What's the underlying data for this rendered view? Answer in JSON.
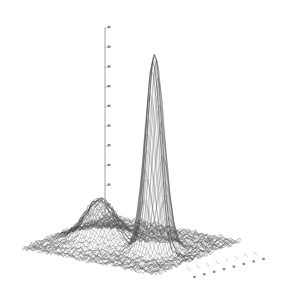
{
  "figure": {
    "kind": "3d-wireframe-surface-plot",
    "background_color": "#ffffff",
    "line_color": "#3a3a3a",
    "mesh_color": "#555555",
    "axis_color": "#8a8a8a",
    "tick_label_color": "#5a5a5a",
    "has_title": false,
    "has_legend": false,
    "has_frame": false,
    "title": "",
    "subtitle": "",
    "note": "Grayscale mesh surface rendered on plain white ground; no visible title, legend, border or colorbar."
  },
  "zaxis": {
    "name": "vertical-axis",
    "label": "",
    "tick_count": 11,
    "tick_labels": [
      "",
      "",
      "",
      "",
      "",
      "",
      "",
      "",
      "",
      "",
      ""
    ],
    "tick_labels_legible": false,
    "tick_label_note": "Z tick annotations are rendered at sub-pixel size in the source image and are not legible; shown as unreadable marks."
  },
  "baseaxis": {
    "name": "base-plane-axis",
    "label": "",
    "tick_count": 8,
    "tick_labels": [
      "",
      "",
      "",
      "",
      "",
      "",
      "",
      ""
    ],
    "tick_labels_legible": false,
    "tick_label_note": "Bottom-right edge tick annotations are illegible at source resolution."
  },
  "chart_data": {
    "type": "surface",
    "title": "",
    "subtitle": "",
    "xlabel": "",
    "ylabel": "",
    "zlabel": "",
    "grid": true,
    "legend": "none",
    "projection": "3d-wireframe",
    "surface_description": "Two-dimensional bimodal density surface: one tall narrow peak and one short broad peak over a near-flat noisy plane.",
    "xlim": [
      0,
      1
    ],
    "ylim": [
      0,
      1
    ],
    "zlim": [
      0,
      1
    ],
    "mesh": {
      "nx": 56,
      "ny": 56
    },
    "peaks": [
      {
        "name": "tall-narrow-peak",
        "cx": 0.7,
        "cy": 0.46,
        "amplitude": 1.0,
        "sigma_x": 0.055,
        "sigma_y": 0.075,
        "relative_height": "tallest",
        "apex_px": [
          207,
          55
        ]
      },
      {
        "name": "short-broad-peak",
        "cx": 0.3,
        "cy": 0.44,
        "amplitude": 0.21,
        "sigma_x": 0.105,
        "sigma_y": 0.125,
        "relative_height": "secondary",
        "apex_px": [
          132,
          211
        ]
      }
    ],
    "baseline_noise_amplitude": 0.012,
    "values_note": "Heights are normalized 0-1; the tall peak reaches the top of the z-axis while the broad peak reaches roughly one fifth of that height."
  },
  "geometry": {
    "base_left_px": [
      22,
      248
    ],
    "base_back_px": [
      108,
      215
    ],
    "base_right_px": [
      262,
      250
    ],
    "base_front_px": [
      155,
      274
    ],
    "zaxis_x_px": 105,
    "zaxis_top_px_y": 28,
    "zaxis_bottom_px_y": 225
  }
}
